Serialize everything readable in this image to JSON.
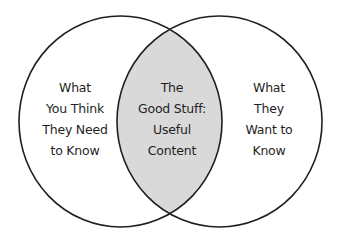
{
  "diagram": {
    "type": "venn",
    "colors": {
      "background": "#ffffff",
      "stroke": "#1f1f1f",
      "intersection_fill": "#d9d9d9",
      "text": "#1f1f1f"
    },
    "sets": [
      {
        "id": "left",
        "lines": [
          "What",
          "You Think",
          "They Need",
          "to Know"
        ]
      },
      {
        "id": "right",
        "lines": [
          "What",
          "They",
          "Want to",
          "Know"
        ]
      }
    ],
    "intersection": {
      "lines": [
        "The",
        "Good Stuff:",
        "Useful",
        "Content"
      ]
    }
  }
}
